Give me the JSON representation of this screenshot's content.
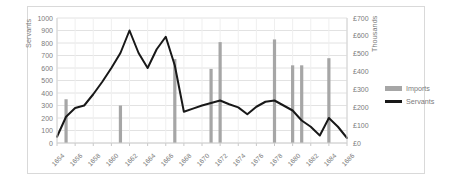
{
  "chart_data": {
    "type": "bar",
    "title": "",
    "subtitle": "",
    "xlabel": "",
    "ylabel": "Servants",
    "y2label": "Thousands",
    "grid": true,
    "legend_position": "right",
    "ylim": [
      0,
      1000
    ],
    "y2lim": [
      0,
      700
    ],
    "y_ticks": [
      "0",
      "100",
      "200",
      "300",
      "400",
      "500",
      "600",
      "700",
      "800",
      "900",
      "1000"
    ],
    "y2_ticks": [
      "£0",
      "£100",
      "£200",
      "£300",
      "£400",
      "£500",
      "£600",
      "£700"
    ],
    "x_tick_labels": [
      "1654",
      "1656",
      "1658",
      "1660",
      "1662",
      "1664",
      "1666",
      "1668",
      "1670",
      "1672",
      "1674",
      "1676",
      "1678",
      "1680",
      "1682",
      "1684",
      "1686"
    ],
    "categories": [
      1654,
      1655,
      1656,
      1657,
      1658,
      1659,
      1660,
      1661,
      1662,
      1663,
      1664,
      1665,
      1666,
      1667,
      1668,
      1669,
      1670,
      1671,
      1672,
      1673,
      1674,
      1675,
      1676,
      1677,
      1678,
      1679,
      1680,
      1681,
      1682,
      1683,
      1684,
      1685,
      1686
    ],
    "series": [
      {
        "name": "Imports",
        "type": "bar",
        "axis": "right",
        "color": "#a6a6a6",
        "unit": "£ Thousands",
        "values": [
          null,
          245,
          null,
          null,
          null,
          null,
          null,
          210,
          null,
          null,
          null,
          null,
          null,
          470,
          null,
          null,
          null,
          415,
          565,
          null,
          null,
          null,
          null,
          null,
          580,
          null,
          435,
          435,
          null,
          null,
          475,
          null,
          null
        ]
      },
      {
        "name": "Servants",
        "type": "line",
        "axis": "left",
        "color": "#181818",
        "values": [
          50,
          210,
          280,
          300,
          390,
          490,
          600,
          720,
          900,
          720,
          600,
          750,
          850,
          620,
          250,
          275,
          300,
          320,
          340,
          310,
          285,
          230,
          290,
          330,
          340,
          300,
          260,
          180,
          130,
          60,
          200,
          130,
          40
        ]
      }
    ]
  },
  "legend": {
    "imports_label": "Imports",
    "servants_label": "Servants"
  },
  "axes": {
    "left_title": "Servants",
    "right_title": "Thousands"
  }
}
